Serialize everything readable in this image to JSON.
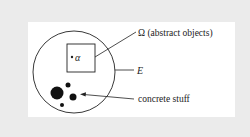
{
  "diagram": {
    "labels": {
      "omega": "Ω (abstract objects)",
      "alpha": "α",
      "e": "E",
      "concrete": "concrete stuff"
    },
    "colors": {
      "frame": "#ebebeb",
      "panel": "#ffffff",
      "ink": "#222222"
    },
    "shapes": {
      "outer_circle": {
        "cx": 74,
        "cy": 72,
        "r": 41
      },
      "omega_box": {
        "x": 67,
        "y": 44,
        "w": 28,
        "h": 28
      },
      "alpha_dot": {
        "cx": 72,
        "cy": 57,
        "r": 1.2
      },
      "concrete_dots": [
        {
          "cx": 57,
          "cy": 93,
          "r": 6.5
        },
        {
          "cx": 68,
          "cy": 85,
          "r": 2.5
        },
        {
          "cx": 73,
          "cy": 97,
          "r": 3.5
        },
        {
          "cx": 62,
          "cy": 105,
          "r": 2
        }
      ]
    }
  }
}
